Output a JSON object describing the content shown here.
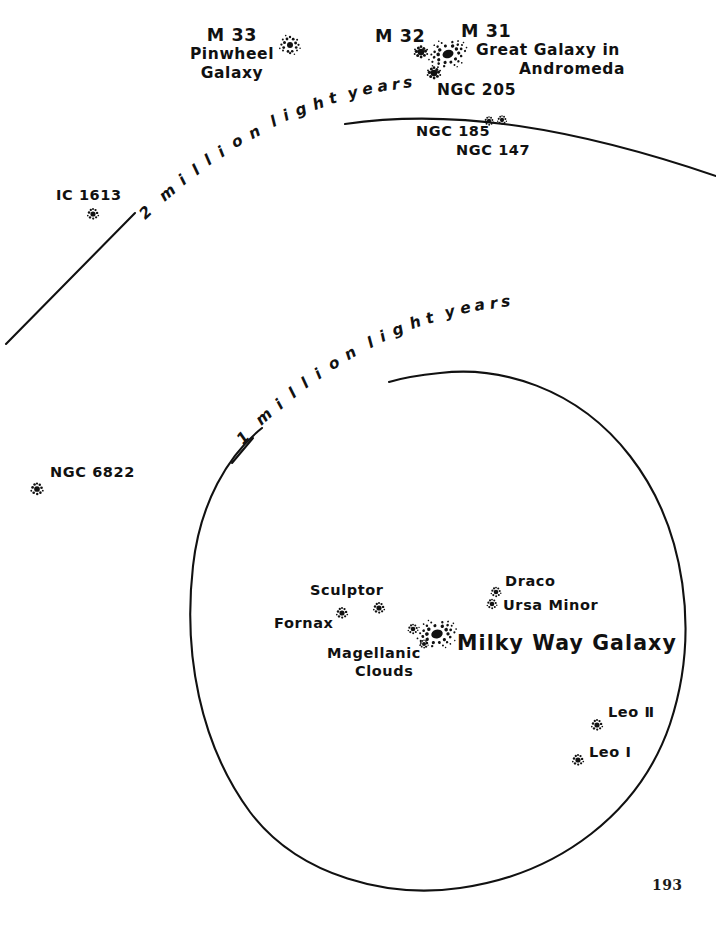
{
  "figure": {
    "kind": "local-group-galaxy-map",
    "page_number": "193",
    "ink_color": "#111111",
    "paper_color": "#ffffff"
  },
  "distance_rings": [
    {
      "id": "ring-2mly",
      "caption": "2 million light years"
    },
    {
      "id": "ring-1mly",
      "caption": "1 million light years"
    }
  ],
  "objects": [
    {
      "id": "m33",
      "label": "M 33",
      "sublabel_1": "Pinwheel",
      "sublabel_2": "Galaxy",
      "glyph": "spiral"
    },
    {
      "id": "m32",
      "label": "M 32",
      "glyph": "blob"
    },
    {
      "id": "m31",
      "label": "M 31",
      "sublabel_1": "Great Galaxy in",
      "sublabel_2": "Andromeda",
      "glyph": "spiral-large"
    },
    {
      "id": "ngc205",
      "label": "NGC 205",
      "glyph": "blob"
    },
    {
      "id": "ngc185",
      "label": "NGC 185",
      "glyph": "star"
    },
    {
      "id": "ngc147",
      "label": "NGC 147",
      "glyph": "star"
    },
    {
      "id": "ic1613",
      "label": "IC 1613",
      "glyph": "star"
    },
    {
      "id": "ngc6822",
      "label": "NGC 6822",
      "glyph": "star"
    },
    {
      "id": "milkyway",
      "label": "Milky Way Galaxy",
      "glyph": "spiral-large"
    },
    {
      "id": "sculptor",
      "label": "Sculptor",
      "glyph": "star"
    },
    {
      "id": "fornax",
      "label": "Fornax",
      "glyph": "star"
    },
    {
      "id": "magellanic",
      "label": "Magellanic",
      "sublabel_1": "Clouds",
      "glyph": "star-pair"
    },
    {
      "id": "draco",
      "label": "Draco",
      "glyph": "star"
    },
    {
      "id": "ursaminor",
      "label": "Ursa Minor",
      "glyph": "star"
    },
    {
      "id": "leo2",
      "label": "Leo Ⅱ",
      "glyph": "star"
    },
    {
      "id": "leo1",
      "label": "Leo Ⅰ",
      "glyph": "star"
    }
  ]
}
